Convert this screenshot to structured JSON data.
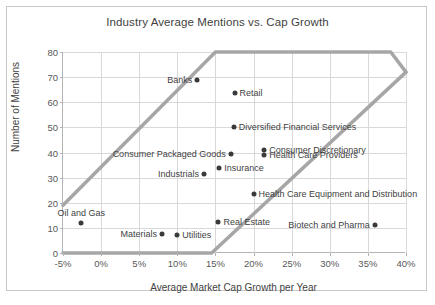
{
  "chart_data": {
    "type": "scatter",
    "title": "Industry Average Mentions vs. Cap Growth",
    "xlabel": "Average Market Cap Growth per Year",
    "ylabel": "Number of Mentions",
    "xlim": [
      -5,
      40
    ],
    "ylim": [
      0,
      80
    ],
    "xticks": [
      "-5%",
      "0%",
      "5%",
      "10%",
      "15%",
      "20%",
      "25%",
      "30%",
      "35%",
      "40%"
    ],
    "xtick_values": [
      -5,
      0,
      5,
      10,
      15,
      20,
      25,
      30,
      35,
      40
    ],
    "yticks": [
      "0",
      "10",
      "20",
      "30",
      "40",
      "50",
      "60",
      "70",
      "80"
    ],
    "ytick_values": [
      0,
      10,
      20,
      30,
      40,
      50,
      60,
      70,
      80
    ],
    "grid": true,
    "legend": "none",
    "points": [
      {
        "label": "Banks",
        "x": 12.6,
        "y": 69,
        "label_pos": "left"
      },
      {
        "label": "Retail",
        "x": 17.5,
        "y": 63.5,
        "label_pos": "right"
      },
      {
        "label": "Diversified Financial Services",
        "x": 17.4,
        "y": 50,
        "label_pos": "right"
      },
      {
        "label": "Consumer Discretionary",
        "x": 21.4,
        "y": 41,
        "label_pos": "right"
      },
      {
        "label": "Health Care Providers",
        "x": 21.4,
        "y": 39,
        "label_pos": "right"
      },
      {
        "label": "Consumer Packaged Goods",
        "x": 17.0,
        "y": 39.5,
        "label_pos": "left"
      },
      {
        "label": "Insurance",
        "x": 15.5,
        "y": 34,
        "label_pos": "right"
      },
      {
        "label": "Industrials",
        "x": 13.5,
        "y": 31.5,
        "label_pos": "left"
      },
      {
        "label": "Health Care Equipment and Distribution",
        "x": 20.0,
        "y": 23.5,
        "label_pos": "right"
      },
      {
        "label": "Real Estate",
        "x": 15.4,
        "y": 12.5,
        "label_pos": "right"
      },
      {
        "label": "Oil and Gas",
        "x": -2.6,
        "y": 12,
        "label_pos": "above"
      },
      {
        "label": "Biotech and Pharma",
        "x": 35.9,
        "y": 11,
        "label_pos": "left"
      },
      {
        "label": "Materials",
        "x": 8.0,
        "y": 7.5,
        "label_pos": "left"
      },
      {
        "label": "Utilities",
        "x": 10.0,
        "y": 7.0,
        "label_pos": "right"
      }
    ],
    "band": {
      "name": "trend-corridor",
      "color": "#a6a6a6",
      "upper_edge": [
        [
          -5,
          19
        ],
        [
          15,
          80
        ],
        [
          38,
          80
        ],
        [
          40,
          72
        ]
      ],
      "lower_edge": [
        [
          -5,
          0
        ],
        [
          14.5,
          0
        ],
        [
          40,
          72
        ]
      ]
    }
  }
}
